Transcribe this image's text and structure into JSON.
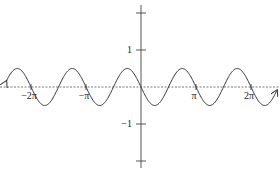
{
  "chart_data": {
    "type": "line",
    "title": "",
    "xlabel": "",
    "ylabel": "",
    "function": "y = -0.5 sin(2x)",
    "xlim_pi": [
      -2.45,
      2.47
    ],
    "ylim": [
      -2.2,
      2.2
    ],
    "grid": false,
    "x_ticks": [
      {
        "value_pi": -2,
        "label": "−2π"
      },
      {
        "value_pi": -1,
        "label": "−π"
      },
      {
        "value_pi": 1,
        "label": "π"
      },
      {
        "value_pi": 2,
        "label": "2π"
      }
    ],
    "y_ticks": [
      {
        "value": 2,
        "label": ""
      },
      {
        "value": 1,
        "label": "1"
      },
      {
        "value": -1,
        "label": "−1"
      },
      {
        "value": -2,
        "label": ""
      }
    ],
    "series": [
      {
        "name": "curve",
        "amplitude": 0.5,
        "frequency": 2,
        "sign": -1,
        "arrows": "both-ends"
      }
    ]
  }
}
